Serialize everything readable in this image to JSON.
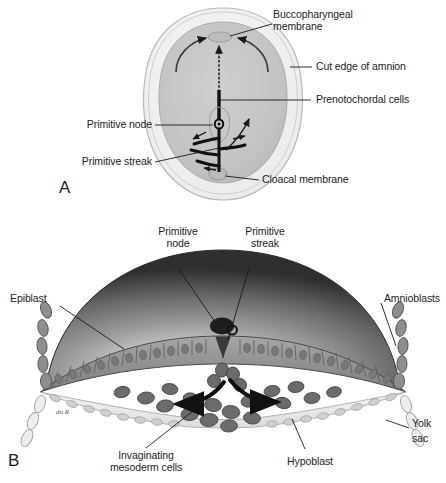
{
  "figure": {
    "kind": "anatomical-diagram",
    "background_color": "#ffffff",
    "ink_color": "#1a1a1a"
  },
  "panels": [
    {
      "letter": "A",
      "view": "Dorsal view of embryonic disc with amnion cut away",
      "disc_fill": "#c6c6c6",
      "amnion_fill": "#f2f2f2",
      "labels": [
        {
          "id": "buccopharyngeal-membrane",
          "line1": "Buccopharyngeal",
          "line2": "membrane"
        },
        {
          "id": "cut-edge-of-amnion",
          "line1": "Cut edge of amnion",
          "line2": ""
        },
        {
          "id": "prenotochordal-cells",
          "line1": "Prenotochordal cells",
          "line2": ""
        },
        {
          "id": "primitive-node",
          "line1": "Primitive node",
          "line2": ""
        },
        {
          "id": "primitive-streak",
          "line1": "Primitive streak",
          "line2": ""
        },
        {
          "id": "cloacal-membrane",
          "line1": "Cloacal membrane",
          "line2": ""
        }
      ]
    },
    {
      "letter": "B",
      "view": "Transverse section through the primitive streak showing cell invagination",
      "epiblast_fill": "#9a9a9a",
      "hypoblast_fill": "#e8e8e8",
      "mesoderm_fill": "#6d6d6d",
      "amnion_dome_dark": "#3c3c3c",
      "amnion_dome_light": "#f0f0f0",
      "labels": [
        {
          "id": "primitive-node",
          "line1": "Primitive",
          "line2": "node"
        },
        {
          "id": "primitive-streak",
          "line1": "Primitive",
          "line2": "streak"
        },
        {
          "id": "epiblast",
          "line1": "Epiblast",
          "line2": ""
        },
        {
          "id": "amnioblasts",
          "line1": "Amnioblasts",
          "line2": ""
        },
        {
          "id": "yolk-sac",
          "line1": "Yolk",
          "line2": "sac"
        },
        {
          "id": "invaginating-mesoderm-cells",
          "line1": "Invaginating",
          "line2": "mesoderm cells"
        },
        {
          "id": "hypoblast",
          "line1": "Hypoblast",
          "line2": ""
        }
      ],
      "artist_signature": "do R"
    }
  ]
}
